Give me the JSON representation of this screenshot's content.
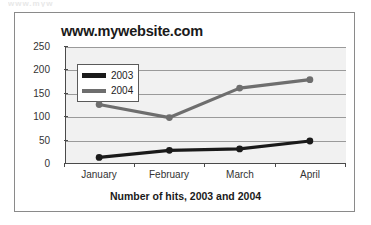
{
  "top_sliver_text": "www.myw",
  "chart_title": "www.mywebsite.com",
  "x_caption": "Number of hits, 2003 and 2004",
  "legend": {
    "position": "inside-top-left",
    "entries": [
      {
        "label": "2003",
        "color": "#1a1a1a"
      },
      {
        "label": "2004",
        "color": "#6e6e6e"
      }
    ]
  },
  "axis": {
    "y_ticks": [
      "250",
      "200",
      "150",
      "100",
      "50",
      "0"
    ],
    "x_ticks": [
      "January",
      "February",
      "March",
      "April"
    ]
  },
  "colors": {
    "plot_background": "#f1f1f1",
    "gridline": "#9a9a9a",
    "axis": "#4a4a4a",
    "frame": "#8a8a8a",
    "series_2003": "#1a1a1a",
    "series_2004": "#6e6e6e"
  },
  "chart_data": {
    "type": "line",
    "title": "www.mywebsite.com",
    "xlabel": "Number of hits, 2003 and 2004",
    "ylabel": "",
    "categories": [
      "January",
      "February",
      "March",
      "April"
    ],
    "series": [
      {
        "name": "2003",
        "values": [
          12,
          27,
          30,
          47
        ],
        "color": "#1a1a1a"
      },
      {
        "name": "2004",
        "values": [
          125,
          97,
          160,
          178
        ],
        "color": "#6e6e6e"
      }
    ],
    "ylim": [
      0,
      250
    ],
    "yticks": [
      0,
      50,
      100,
      150,
      200,
      250
    ],
    "grid": true,
    "legend_position": "inside-top-left",
    "markers": true
  }
}
